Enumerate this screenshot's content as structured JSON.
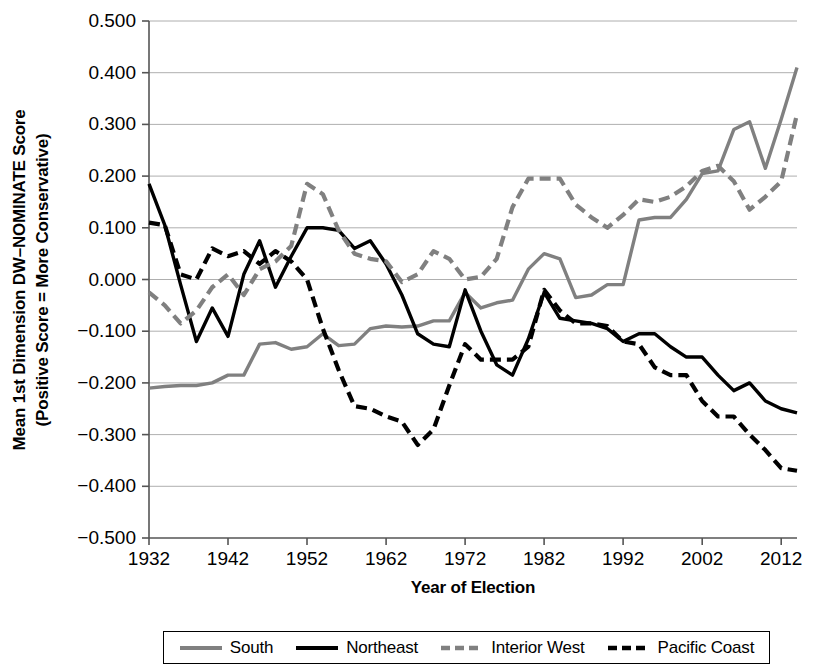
{
  "figure": {
    "ylabel_line1": "Mean 1st Dimension DW–NOMINATE Score",
    "ylabel_line2": "(Positive Score = More Conservative)",
    "xlabel": "Year of Election"
  },
  "legend": {
    "position": "bottom",
    "items": [
      {
        "label": "South",
        "color": "#808080",
        "style": "solid",
        "name": "legend-item-south"
      },
      {
        "label": "Northeast",
        "color": "#000000",
        "style": "solid",
        "name": "legend-item-northeast"
      },
      {
        "label": "Interior West",
        "color": "#808080",
        "style": "dashed",
        "name": "legend-item-interior-west"
      },
      {
        "label": "Pacific Coast",
        "color": "#000000",
        "style": "dashed",
        "name": "legend-item-pacific-coast"
      }
    ]
  },
  "chart_data": {
    "type": "line",
    "title": "",
    "xlabel": "Year of Election",
    "ylabel": "Mean 1st Dimension DW–NOMINATE Score (Positive Score = More Conservative)",
    "xlim": [
      1932,
      2014
    ],
    "ylim": [
      -0.5,
      0.5
    ],
    "ytick_labels": [
      "0.500",
      "0.400",
      "0.300",
      "0.200",
      "0.100",
      "0.000",
      "-0.100",
      "-0.200",
      "-0.300",
      "-0.400",
      "-0.500"
    ],
    "ytick_values": [
      0.5,
      0.4,
      0.3,
      0.2,
      0.1,
      0.0,
      -0.1,
      -0.2,
      -0.3,
      -0.4,
      -0.5
    ],
    "xtick_labels": [
      "1932",
      "1942",
      "1952",
      "1962",
      "1972",
      "1982",
      "1992",
      "2002",
      "2012"
    ],
    "xtick_values": [
      1932,
      1942,
      1952,
      1962,
      1972,
      1982,
      1992,
      2002,
      2012
    ],
    "grid": "horizontal",
    "x": [
      1932,
      1934,
      1936,
      1938,
      1940,
      1942,
      1944,
      1946,
      1948,
      1950,
      1952,
      1954,
      1956,
      1958,
      1960,
      1962,
      1964,
      1966,
      1968,
      1970,
      1972,
      1974,
      1976,
      1978,
      1980,
      1982,
      1984,
      1986,
      1988,
      1990,
      1992,
      1994,
      1996,
      1998,
      2000,
      2002,
      2004,
      2006,
      2008,
      2010,
      2012,
      2014
    ],
    "series": [
      {
        "name": "South",
        "color": "#808080",
        "style": "solid",
        "values": [
          -0.21,
          -0.207,
          -0.205,
          -0.205,
          -0.2,
          -0.185,
          -0.185,
          -0.125,
          -0.122,
          -0.135,
          -0.13,
          -0.105,
          -0.128,
          -0.125,
          -0.095,
          -0.09,
          -0.092,
          -0.09,
          -0.08,
          -0.08,
          -0.025,
          -0.055,
          -0.045,
          -0.04,
          0.02,
          0.05,
          0.04,
          -0.035,
          -0.03,
          -0.01,
          -0.01,
          0.115,
          0.12,
          0.12,
          0.155,
          0.205,
          0.21,
          0.29,
          0.305,
          0.215,
          0.31,
          0.41
        ]
      },
      {
        "name": "Northeast",
        "color": "#000000",
        "style": "solid",
        "values": [
          0.185,
          0.105,
          -0.01,
          -0.12,
          -0.055,
          -0.11,
          0.01,
          0.075,
          -0.015,
          0.045,
          0.1,
          0.1,
          0.095,
          0.06,
          0.075,
          0.03,
          -0.03,
          -0.105,
          -0.125,
          -0.13,
          -0.02,
          -0.1,
          -0.165,
          -0.185,
          -0.115,
          -0.025,
          -0.075,
          -0.08,
          -0.085,
          -0.095,
          -0.12,
          -0.105,
          -0.105,
          -0.13,
          -0.15,
          -0.15,
          -0.185,
          -0.215,
          -0.2,
          -0.235,
          -0.25,
          -0.258
        ]
      },
      {
        "name": "Interior West",
        "color": "#808080",
        "style": "dashed",
        "values": [
          -0.025,
          -0.05,
          -0.085,
          -0.06,
          -0.015,
          0.01,
          -0.03,
          0.02,
          0.035,
          0.065,
          0.185,
          0.165,
          0.095,
          0.05,
          0.04,
          0.035,
          -0.005,
          0.01,
          0.055,
          0.04,
          0.0,
          0.005,
          0.04,
          0.14,
          0.195,
          0.195,
          0.195,
          0.145,
          0.12,
          0.1,
          0.125,
          0.155,
          0.15,
          0.16,
          0.18,
          0.21,
          0.22,
          0.19,
          0.135,
          0.16,
          0.19,
          0.32
        ]
      },
      {
        "name": "Pacific Coast",
        "color": "#000000",
        "style": "dashed",
        "values": [
          0.11,
          0.105,
          0.01,
          0.0,
          0.06,
          0.045,
          0.055,
          0.03,
          0.055,
          0.035,
          0.0,
          -0.095,
          -0.175,
          -0.245,
          -0.25,
          -0.265,
          -0.275,
          -0.32,
          -0.29,
          -0.205,
          -0.125,
          -0.155,
          -0.155,
          -0.155,
          -0.13,
          -0.02,
          -0.06,
          -0.085,
          -0.085,
          -0.09,
          -0.12,
          -0.125,
          -0.17,
          -0.185,
          -0.185,
          -0.235,
          -0.265,
          -0.265,
          -0.3,
          -0.33,
          -0.365,
          -0.37
        ]
      }
    ]
  }
}
